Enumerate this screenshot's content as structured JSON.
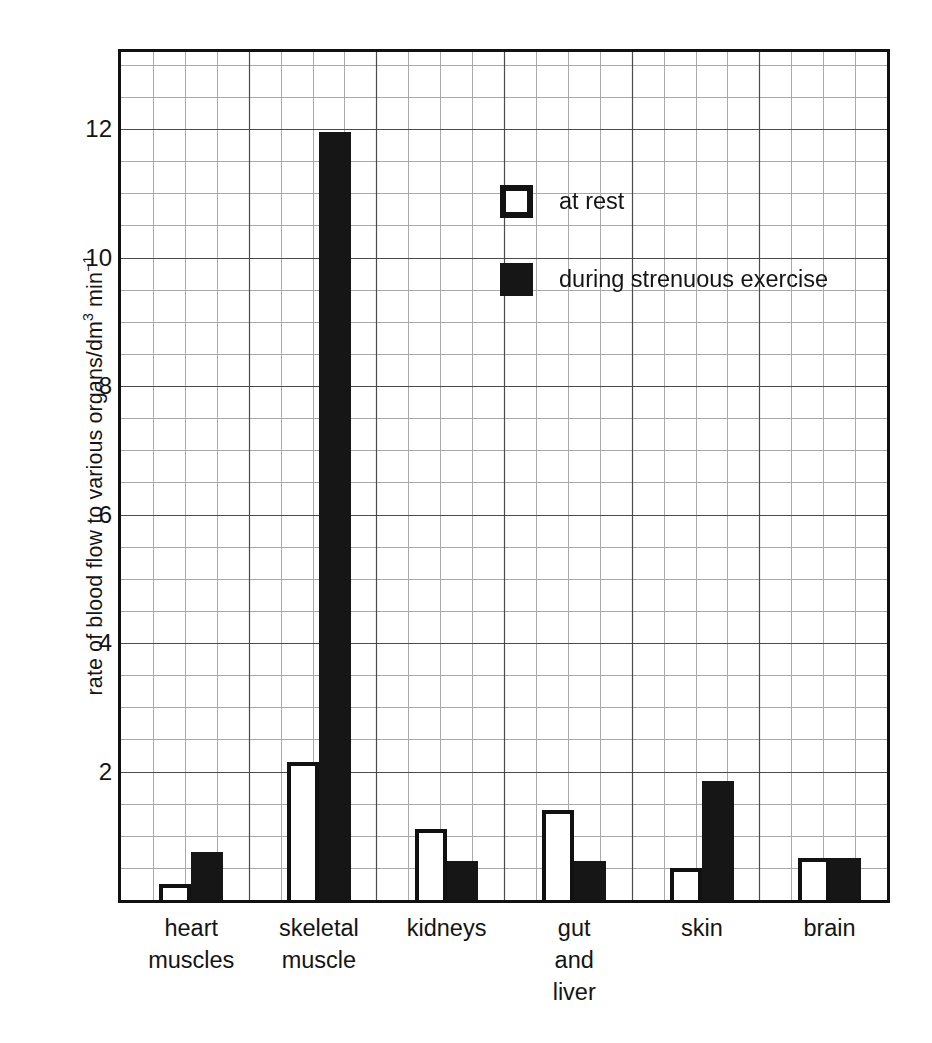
{
  "chart_data": {
    "type": "bar",
    "title": "",
    "subtitle": "",
    "xlabel": "",
    "ylabel": "rate of blood flow to various organs/dm3 min-1",
    "ylabel_parts": {
      "prefix": "rate of blood flow to various organs/dm",
      "sup1": "3",
      "mid": " min",
      "sup2": "−1"
    },
    "categories": [
      "heart muscles",
      "skeletal muscle",
      "kidneys",
      "gut and liver",
      "skin",
      "brain"
    ],
    "category_lines": [
      [
        "heart",
        "muscles"
      ],
      [
        "skeletal",
        "muscle"
      ],
      [
        "kidneys"
      ],
      [
        "gut",
        "and",
        "liver"
      ],
      [
        "skin"
      ],
      [
        "brain"
      ]
    ],
    "series": [
      {
        "name": "at rest",
        "values": [
          0.25,
          2.15,
          1.1,
          1.4,
          0.5,
          0.65
        ]
      },
      {
        "name": "during strenuous exercise",
        "values": [
          0.75,
          11.95,
          0.6,
          0.6,
          1.85,
          0.65
        ]
      }
    ],
    "ylim": [
      0,
      13.2
    ],
    "ytick_values": [
      2,
      4,
      6,
      8,
      10,
      12
    ],
    "ytick_labels": [
      "2",
      "4",
      "6",
      "8",
      "10",
      "12"
    ],
    "y_minor_step": 0.5,
    "grid": true,
    "grid_minor": true,
    "legend_position": "inside-upper-center",
    "colors": {
      "at_rest_fill": "#ffffff",
      "at_rest_edge": "#111111",
      "exercise_fill": "#161616",
      "grid_minor": "#a9a9a9",
      "grid_major": "#4a4a4a",
      "axis": "#111111",
      "background": "#ffffff"
    }
  },
  "legend": {
    "items": [
      {
        "label": "at rest",
        "swatch": "open-square-icon"
      },
      {
        "label": "during strenuous exercise",
        "swatch": "filled-square-icon"
      }
    ]
  },
  "axes": {
    "y_ticks": [
      "12",
      "10",
      "8",
      "6",
      "4",
      "2"
    ]
  }
}
